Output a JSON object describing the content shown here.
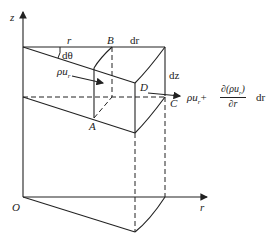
{
  "diagram": {
    "type": "cylindrical-coordinate control volume",
    "axes": {
      "z_label": "z",
      "r_label": "r",
      "origin_label": "O"
    },
    "points": {
      "A": "A",
      "B": "B",
      "C": "C",
      "D": "D"
    },
    "dimensions": {
      "r": "r",
      "dtheta": "dθ",
      "dr": "dr",
      "dz": "dz"
    },
    "flux_in": {
      "rho": "ρ",
      "u": "u",
      "sub": "r"
    },
    "flux_out": {
      "prefix": "ρu",
      "sub": "r",
      "plus": "+",
      "numerator": "∂(ρu",
      "numerator_sub": "r",
      "numerator_close": ")",
      "denominator": "∂r",
      "suffix": "dr"
    },
    "colors": {
      "line": "#222222",
      "background": "#ffffff"
    }
  }
}
